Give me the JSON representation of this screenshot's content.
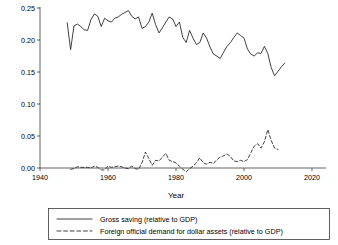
{
  "chart_data": {
    "type": "line",
    "title": "",
    "xlabel": "Year",
    "ylabel": "",
    "xlim": [
      1940,
      2020
    ],
    "ylim": [
      0.0,
      0.25
    ],
    "grid": false,
    "legend_position": "bottom",
    "x_ticks": [
      "1940",
      "1960",
      "1980",
      "2000",
      "2020"
    ],
    "x_tick_values": [
      1940,
      1960,
      1980,
      2000,
      2020
    ],
    "y_ticks": [
      "0.00",
      "0.05",
      "0.10",
      "0.15",
      "0.20",
      "0.25"
    ],
    "y_tick_values": [
      0.0,
      0.05,
      0.1,
      0.15,
      0.2,
      0.25
    ],
    "series": [
      {
        "name": "Gross saving (relative to GDP)",
        "style": "solid",
        "color": "#2b2b2b",
        "x": [
          1948,
          1949,
          1950,
          1951,
          1952,
          1953,
          1954,
          1955,
          1956,
          1957,
          1958,
          1959,
          1960,
          1961,
          1962,
          1963,
          1964,
          1965,
          1966,
          1967,
          1968,
          1969,
          1970,
          1971,
          1972,
          1973,
          1974,
          1975,
          1976,
          1977,
          1978,
          1979,
          1980,
          1981,
          1982,
          1983,
          1984,
          1985,
          1986,
          1987,
          1988,
          1989,
          1990,
          1991,
          1992,
          1993,
          1994,
          1995,
          1996,
          1997,
          1998,
          1999,
          2000,
          2001,
          2002,
          2003,
          2004,
          2005,
          2006,
          2007,
          2008,
          2009,
          2010,
          2011,
          2012
        ],
        "values": [
          0.227,
          0.185,
          0.222,
          0.225,
          0.221,
          0.216,
          0.215,
          0.232,
          0.241,
          0.237,
          0.221,
          0.234,
          0.23,
          0.228,
          0.234,
          0.236,
          0.24,
          0.243,
          0.246,
          0.237,
          0.233,
          0.236,
          0.218,
          0.221,
          0.228,
          0.242,
          0.224,
          0.211,
          0.219,
          0.228,
          0.236,
          0.233,
          0.221,
          0.228,
          0.204,
          0.196,
          0.215,
          0.203,
          0.193,
          0.196,
          0.211,
          0.203,
          0.189,
          0.178,
          0.175,
          0.171,
          0.181,
          0.19,
          0.196,
          0.204,
          0.211,
          0.207,
          0.203,
          0.186,
          0.178,
          0.175,
          0.18,
          0.179,
          0.19,
          0.179,
          0.157,
          0.144,
          0.151,
          0.158,
          0.164
        ]
      },
      {
        "name": "Foreign official demand for dollar assets (relative to GDP)",
        "style": "dashed",
        "color": "#2b2b2b",
        "x": [
          1949,
          1950,
          1951,
          1952,
          1953,
          1954,
          1955,
          1956,
          1957,
          1958,
          1959,
          1960,
          1961,
          1962,
          1963,
          1964,
          1965,
          1966,
          1967,
          1968,
          1969,
          1970,
          1971,
          1972,
          1973,
          1974,
          1975,
          1976,
          1977,
          1978,
          1979,
          1980,
          1981,
          1982,
          1983,
          1984,
          1985,
          1986,
          1987,
          1988,
          1989,
          1990,
          1991,
          1992,
          1993,
          1994,
          1995,
          1996,
          1997,
          1998,
          1999,
          2000,
          2001,
          2002,
          2003,
          2004,
          2005,
          2006,
          2007,
          2008,
          2009,
          2010
        ],
        "values": [
          -0.002,
          -0.001,
          0.002,
          0.001,
          0.001,
          0.001,
          0.0,
          0.003,
          0.001,
          -0.003,
          -0.003,
          0.003,
          0.001,
          0.002,
          0.003,
          0.002,
          0.0,
          -0.001,
          0.003,
          -0.001,
          -0.002,
          0.008,
          0.025,
          0.015,
          0.004,
          0.012,
          0.011,
          0.017,
          0.023,
          0.012,
          0.01,
          0.008,
          0.003,
          -0.002,
          -0.006,
          -0.001,
          0.003,
          0.008,
          0.016,
          0.008,
          0.006,
          0.009,
          0.007,
          0.013,
          0.017,
          0.019,
          0.022,
          0.018,
          0.011,
          0.01,
          0.012,
          0.01,
          0.013,
          0.024,
          0.034,
          0.038,
          0.031,
          0.041,
          0.06,
          0.043,
          0.031,
          0.029
        ]
      }
    ]
  },
  "legend": {
    "entries": [
      {
        "label": "Gross saving (relative to GDP)",
        "style": "solid"
      },
      {
        "label": "Foreign official demand for dollar assets (relative to GDP)",
        "style": "dashed"
      }
    ]
  }
}
